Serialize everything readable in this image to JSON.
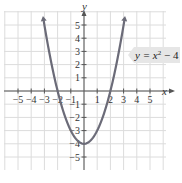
{
  "chart_data": {
    "type": "line",
    "title": "",
    "xlabel": "x",
    "ylabel": "y",
    "xlim": [
      -5.9,
      6
    ],
    "ylim": [
      -6,
      6.1
    ],
    "grid": true,
    "x_ticks": [
      -5,
      -4,
      -3,
      -2,
      -1,
      1,
      2,
      3,
      4,
      5
    ],
    "y_ticks": [
      -5,
      -4,
      -3,
      -2,
      -1,
      1,
      2,
      3,
      4,
      5
    ],
    "x_tick_labels": [
      "−5",
      "−4",
      "−3",
      "−2",
      "−1",
      "1",
      "2",
      "3",
      "4",
      "5"
    ],
    "y_tick_labels": [
      "−5",
      "−4",
      "−3",
      "−2",
      "−1",
      "1",
      "2",
      "3",
      "4",
      "5"
    ],
    "series": [
      {
        "name": "y = x² − 4",
        "function": "x^2 - 4",
        "x": [
          -3.1,
          -3,
          -2.5,
          -2,
          -1.5,
          -1,
          -0.5,
          0,
          0.5,
          1,
          1.5,
          2,
          2.5,
          3,
          3.1
        ],
        "values": [
          5.61,
          5,
          2.25,
          0,
          -1.75,
          -3,
          -3.75,
          -4,
          -3.75,
          -3,
          -1.75,
          0,
          2.25,
          5,
          5.61
        ],
        "color": "#6b6b78"
      }
    ],
    "annotations": [
      {
        "text": "y = x² − 4",
        "position": "right, near y=3"
      }
    ],
    "legend": "none"
  },
  "labels": {
    "x_axis": "x",
    "y_axis": "y",
    "equation_prefix": "y = x",
    "equation_exp": "2",
    "equation_suffix": " − 4",
    "x_ticks": [
      "−5",
      "−4",
      "−3",
      "−2",
      "−1",
      "1",
      "2",
      "3",
      "4",
      "5"
    ],
    "y_ticks": [
      "5",
      "4",
      "3",
      "2",
      "1",
      "−1",
      "−2",
      "−3",
      "−4",
      "−5"
    ]
  },
  "colors": {
    "grid": "#dcdcdc",
    "axis": "#555555",
    "curve": "#6b6b78",
    "label_box": "#e6e6e6"
  }
}
